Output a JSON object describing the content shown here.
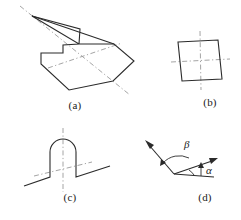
{
  "figure": {
    "background_color": "#ffffff",
    "stroke_color": "#2b2b2b",
    "dash_color": "#9a9a9a",
    "width": 241,
    "height": 220
  },
  "panels": [
    {
      "id": "a",
      "caption": "(a)",
      "name": "irregular-polygon-with-symmetry-axes",
      "description": "Irregular concave polygon outline with two dash-dot symmetry axis lines crossing it",
      "outline_points": "26,14 74,27 73,42 57,43 57,51 35,51 35,62 63,88 107,79 128,59 108,42 73,42",
      "solid_path": "M26,14 L74,27 L73,42 L57,43 L57,51 L35,51 L35,62 L63,88 L107,79 L128,59 L108,42 L73,42 Z",
      "dash_axes": [
        {
          "name": "axis-major-diagonal",
          "x1": 14,
          "y1": 4,
          "x2": 124,
          "y2": 93
        },
        {
          "name": "axis-minor-horizontal",
          "x1": 42,
          "y1": 66,
          "x2": 116,
          "y2": 41
        }
      ]
    },
    {
      "id": "b",
      "caption": "(b)",
      "name": "parallelogram-with-symmetry-axes",
      "description": "Small slanted parallelogram with vertical and horizontal dash-dot centre lines",
      "solid_path": "M8,16 L48,14 L52,53 L12,55 Z",
      "dash_axes": [
        {
          "name": "axis-vertical",
          "x1": 30,
          "y1": 5,
          "x2": 31,
          "y2": 64
        },
        {
          "name": "axis-horizontal",
          "x1": 1,
          "y1": 36,
          "x2": 60,
          "y2": 33
        }
      ]
    },
    {
      "id": "c",
      "caption": "(c)",
      "name": "profile-bump-with-symmetry-axes",
      "description": "Inclined baseline profile with a rounded rectangular bump, vertical dash-dot axis and slanted dash-dot axis",
      "solid_path": "M2,64 L28,55 L28,30 A13,13 0 0 1 54,30 L54,55 L88,44",
      "dash_axes": [
        {
          "name": "axis-vertical",
          "x1": 41,
          "y1": 6,
          "x2": 41,
          "y2": 70
        },
        {
          "name": "axis-slanted",
          "x1": 12,
          "y1": 54,
          "x2": 70,
          "y2": 40
        }
      ]
    },
    {
      "id": "d",
      "caption": "(d)",
      "name": "two-vectors-with-angles",
      "description": "Two arrow vectors emanating from a common vertex with labelled angles alpha and beta",
      "vertex": {
        "x": 32,
        "y": 42
      },
      "vectors": [
        {
          "name": "vector-upper-left",
          "x1": 32,
          "y1": 42,
          "x2": 4,
          "y2": 10
        },
        {
          "name": "vector-right",
          "x1": 32,
          "y1": 42,
          "x2": 74,
          "y2": 28
        },
        {
          "name": "baseline-right",
          "x1": 32,
          "y1": 42,
          "x2": 72,
          "y2": 44
        }
      ],
      "angle_labels": [
        {
          "name": "angle-beta",
          "symbol": "β",
          "x": 43,
          "y": 17
        },
        {
          "name": "angle-alpha",
          "symbol": "α",
          "x": 64,
          "y": 40
        }
      ]
    }
  ],
  "captions": {
    "a": "(a)",
    "b": "(b)",
    "c": "(c)",
    "d": "(d)"
  }
}
